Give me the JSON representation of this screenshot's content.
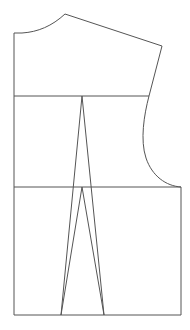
{
  "diagram": {
    "stroke_color": "#555555",
    "background_color": "#ffffff",
    "parts": [
      "neckline",
      "shoulder-seam",
      "armhole",
      "center-front",
      "bust-line",
      "waist-line",
      "hem-line",
      "side-seam",
      "outer-dart",
      "inner-dart"
    ]
  }
}
